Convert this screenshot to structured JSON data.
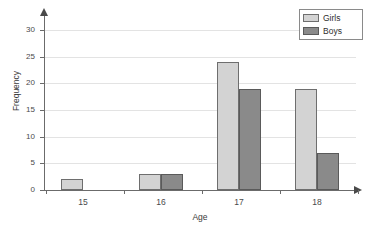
{
  "chart_data": {
    "type": "bar",
    "title": "",
    "xlabel": "Age",
    "ylabel": "Frequency",
    "categories": [
      "15",
      "16",
      "17",
      "18"
    ],
    "series": [
      {
        "name": "Girls",
        "values": [
          2,
          3,
          24,
          19
        ],
        "color": "#d3d3d3"
      },
      {
        "name": "Boys",
        "values": [
          0,
          3,
          19,
          7
        ],
        "color": "#8a8a8a"
      }
    ],
    "ylim": [
      0,
      30
    ],
    "ytick_values": [
      0,
      5,
      10,
      15,
      20,
      25,
      30
    ],
    "ytick_labels": [
      "0",
      "5",
      "10",
      "15",
      "20",
      "25",
      "30"
    ],
    "grid": "horizontal",
    "legend_position": "top-right"
  },
  "legend": {
    "items": [
      {
        "label": "Girls"
      },
      {
        "label": "Boys"
      }
    ]
  },
  "axes": {
    "x_title": "Age",
    "y_title": "Frequency"
  },
  "colors": {
    "girls": "#d3d3d3",
    "boys": "#8a8a8a",
    "axis": "#6b6b6b",
    "grid": "#e3e3e3",
    "background": "#ffffff"
  }
}
